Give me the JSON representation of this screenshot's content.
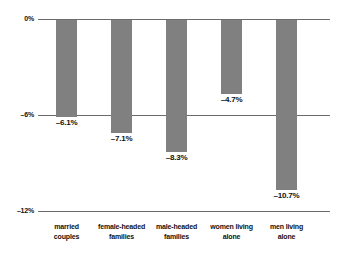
{
  "chart_data": {
    "type": "bar",
    "title": "",
    "subtitle": "",
    "xlabel": "",
    "ylabel": "",
    "ylim": [
      -12,
      0
    ],
    "grid": true,
    "legend": false,
    "orientation": "vertical",
    "units": "percent",
    "categories": [
      "married couples",
      "female-headed families",
      "male-headed families",
      "women living alone",
      "men living alone"
    ],
    "category_lines": [
      [
        "married",
        "couples"
      ],
      [
        "female-headed",
        "families"
      ],
      [
        "male-headed",
        "families"
      ],
      [
        "women living",
        "alone"
      ],
      [
        "men living",
        "alone"
      ]
    ],
    "values": [
      -6.1,
      -7.1,
      -8.3,
      -4.7,
      -10.7
    ],
    "data_labels": [
      "–6.1%",
      "–7.1%",
      "–8.3%",
      "–4.7%",
      "–10.7%"
    ],
    "y_ticks": [
      0,
      -6,
      -12
    ],
    "y_tick_labels": [
      "0%",
      "–6%",
      "–12%"
    ],
    "colors": {
      "bar_fill": "#808080",
      "bar_edge": "#6d6d6d",
      "gridline": "#6b6b6b",
      "text": "#111111",
      "background": "#ffffff"
    }
  }
}
